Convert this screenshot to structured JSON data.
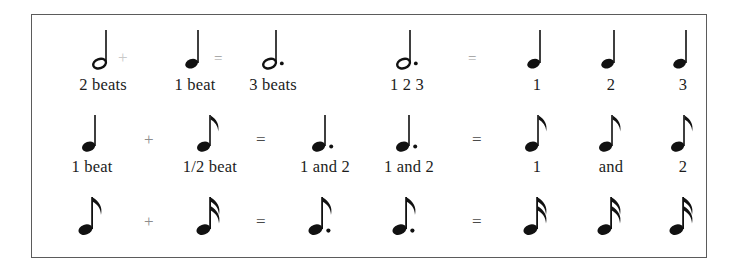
{
  "document": {
    "title": "Note duration equivalence chart",
    "type": "music-notation-reference",
    "border_color": "#5b5b5b",
    "text_color": "#1c1c1c"
  },
  "operators": {
    "plus": "+",
    "equals": "=",
    "equals_faint": "–"
  },
  "rows": [
    {
      "id": "row-1",
      "left": {
        "items": [
          {
            "glyph": "half-note",
            "caption": "2 beats"
          },
          {
            "glyph": "quarter-note",
            "caption": "1 beat"
          },
          {
            "glyph": "dotted-half-note",
            "caption": "3 beats"
          }
        ],
        "operator_1": "+",
        "operator_2": "="
      },
      "right": {
        "items": [
          {
            "glyph": "dotted-half-note",
            "caption": "1 2 3"
          },
          {
            "glyph": "quarter-note",
            "caption": "1"
          },
          {
            "glyph": "quarter-note",
            "caption": "2"
          },
          {
            "glyph": "quarter-note",
            "caption": "3"
          }
        ],
        "operator": "="
      }
    },
    {
      "id": "row-2",
      "left": {
        "items": [
          {
            "glyph": "quarter-note",
            "caption": "1 beat"
          },
          {
            "glyph": "eighth-note",
            "caption": "1/2 beat"
          },
          {
            "glyph": "dotted-quarter-note",
            "caption": "1  and  2"
          }
        ],
        "operator_1": "+",
        "operator_2": "="
      },
      "right": {
        "items": [
          {
            "glyph": "dotted-quarter-note",
            "caption": "1  and  2"
          },
          {
            "glyph": "eighth-note",
            "caption": "1"
          },
          {
            "glyph": "eighth-note",
            "caption": "and"
          },
          {
            "glyph": "eighth-note",
            "caption": "2"
          }
        ],
        "operator": "="
      }
    },
    {
      "id": "row-3",
      "left": {
        "items": [
          {
            "glyph": "eighth-note",
            "caption": ""
          },
          {
            "glyph": "sixteenth-note",
            "caption": ""
          },
          {
            "glyph": "dotted-eighth-note",
            "caption": ""
          }
        ],
        "operator_1": "+",
        "operator_2": "="
      },
      "right": {
        "items": [
          {
            "glyph": "dotted-eighth-note",
            "caption": ""
          },
          {
            "glyph": "sixteenth-note",
            "caption": ""
          },
          {
            "glyph": "sixteenth-note",
            "caption": ""
          },
          {
            "glyph": "sixteenth-note",
            "caption": ""
          }
        ],
        "operator": "="
      }
    }
  ]
}
